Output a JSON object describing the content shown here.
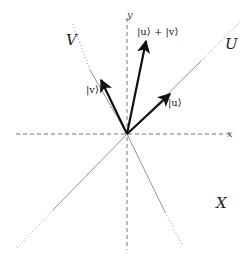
{
  "diagram": {
    "title": "",
    "origin": {
      "x": 127,
      "y": 134
    },
    "colors": {
      "axis": "#777777",
      "line": "#888888",
      "vector": "#111111",
      "text": "#222222"
    },
    "axes": {
      "x": {
        "label": "x",
        "from": [
          16,
          134
        ],
        "to": [
          232,
          134
        ],
        "style": "dashed"
      },
      "y": {
        "label": "y",
        "from": [
          127,
          18
        ],
        "to": [
          127,
          250
        ],
        "style": "dashed"
      }
    },
    "subspaces": [
      {
        "name": "U",
        "label": "U",
        "solid_to": [
          201,
          61
        ],
        "dotted_to": [
          240,
          22
        ]
      },
      {
        "name": "V",
        "label": "V",
        "solid_to": [
          90,
          70
        ],
        "dotted_to": [
          72,
          22
        ]
      },
      {
        "name": "lower-left",
        "label": "",
        "solid_to": [
          53,
          210
        ],
        "dotted_to": [
          17,
          248
        ]
      },
      {
        "name": "lower-right",
        "label": "",
        "solid_to": [
          165,
          212
        ],
        "dotted_to": [
          183,
          246
        ]
      }
    ],
    "vectors": [
      {
        "name": "u",
        "label": "|u⟩",
        "tip": [
          170,
          94
        ]
      },
      {
        "name": "v",
        "label": "|v⟩",
        "tip": [
          101,
          80
        ]
      },
      {
        "name": "u-plus-v",
        "label": "|u⟩ + |v⟩",
        "tip": [
          146,
          41
        ]
      }
    ],
    "labels": {
      "U": "U",
      "V": "V",
      "X": "X",
      "x_axis": "x",
      "y_axis": "y",
      "u": "|u⟩",
      "v": "|v⟩",
      "u_plus_v": "|u⟩ + |v⟩"
    }
  }
}
